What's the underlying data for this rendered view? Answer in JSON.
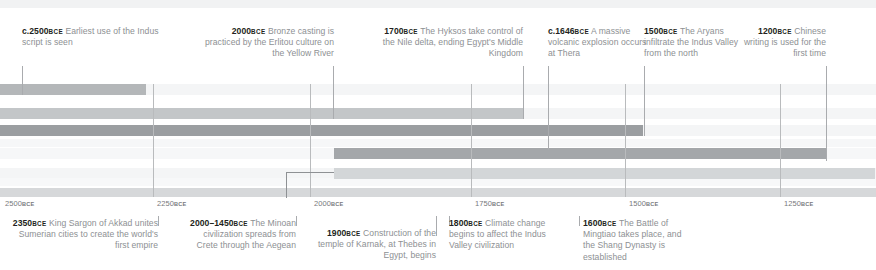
{
  "chart_data": {
    "type": "table",
    "title": "",
    "xlabel": "",
    "ylabel": "",
    "axis": {
      "orientation": "horizontal",
      "direction": "bce-descending",
      "range_bce": [
        2560,
        1180
      ],
      "ticks": [
        {
          "value": 2500,
          "label": "2500",
          "era": "BCE",
          "x": 5
        },
        {
          "value": 2250,
          "label": "2250",
          "era": "BCE",
          "x": 157
        },
        {
          "value": 2000,
          "label": "2000",
          "era": "BCE",
          "x": 314
        },
        {
          "value": 1750,
          "label": "1750",
          "era": "BCE",
          "x": 475
        },
        {
          "value": 1500,
          "label": "1500",
          "era": "BCE",
          "x": 629
        },
        {
          "value": 1250,
          "label": "1250",
          "era": "BCE",
          "x": 784
        }
      ]
    },
    "bars": [
      {
        "name": "era-bar-1",
        "x": 0,
        "width": 146,
        "y": 84,
        "color": "#b4b7b9"
      },
      {
        "name": "era-bar-2",
        "x": 0,
        "width": 523,
        "y": 108,
        "color": "#c3c6c8"
      },
      {
        "name": "era-bar-3",
        "x": 0,
        "width": 643,
        "y": 125,
        "color": "#9b9ea1"
      },
      {
        "name": "era-bar-4",
        "x": 334,
        "width": 492,
        "y": 148,
        "color": "#a4a7aa"
      },
      {
        "name": "era-bar-5",
        "x": 334,
        "width": 541,
        "y": 168,
        "color": "#d3d6d8"
      }
    ],
    "background_bands": [
      {
        "y": 0,
        "height": 8,
        "color": "#f1f2f3"
      },
      {
        "y": 84,
        "height": 11,
        "color": "#f4f5f6"
      },
      {
        "y": 108,
        "height": 11,
        "color": "#f4f5f6"
      },
      {
        "y": 125,
        "height": 11,
        "color": "#f4f5f6"
      },
      {
        "y": 139,
        "height": 8,
        "color": "#f6f7f8"
      },
      {
        "y": 148,
        "height": 11,
        "color": "#f6f7f8"
      },
      {
        "y": 168,
        "height": 11,
        "color": "#f4f5f6"
      },
      {
        "y": 178,
        "height": 8,
        "color": "#f7f8f9"
      }
    ]
  },
  "events_top": [
    {
      "year": "c.2500",
      "era": "BCE",
      "text": "Earliest use of the Indus script is seen",
      "align": "left",
      "label_x": 22,
      "label_y": 26,
      "label_w": 150,
      "leader_x": 22,
      "leader_y": 66,
      "leader_h": 29
    },
    {
      "year": "2000",
      "era": "BCE",
      "text": "Bronze casting is practiced by the Erlitou culture on the Yellow River",
      "align": "right",
      "label_x": 198,
      "label_y": 26,
      "label_w": 136,
      "leader_x": 333,
      "leader_y": 66,
      "leader_h": 53
    },
    {
      "year": "1700",
      "era": "BCE",
      "text": "The Hyksos take control of the Nile delta, ending Egypt's Middle Kingdom",
      "align": "right",
      "label_x": 370,
      "label_y": 26,
      "label_w": 153,
      "leader_x": 523,
      "leader_y": 66,
      "leader_h": 53
    },
    {
      "year": "c.1646",
      "era": "BCE",
      "text": "A massive volcanic explosion occurs at Thera",
      "align": "left",
      "label_x": 548,
      "label_y": 26,
      "label_w": 100,
      "leader_x": 548,
      "leader_y": 66,
      "leader_h": 84
    },
    {
      "year": "1500",
      "era": "BCE",
      "text": "The Aryans infiltrate the Indus Valley from the north",
      "align": "left",
      "label_x": 644,
      "label_y": 26,
      "label_w": 112,
      "leader_x": 644,
      "leader_y": 66,
      "leader_h": 70
    },
    {
      "year": "1200",
      "era": "BCE",
      "text": "Chinese writing is used for the first time",
      "align": "right",
      "label_x": 742,
      "label_y": 26,
      "label_w": 84,
      "leader_x": 826,
      "leader_y": 66,
      "leader_h": 95
    }
  ],
  "events_bottom": [
    {
      "year": "2350",
      "era": "BCE",
      "text": "King Sargon of Akkad unites Sumerian cities to create the world's first empire",
      "align": "right",
      "label_x": 12,
      "label_y": 218,
      "label_w": 146,
      "leader_x": 158,
      "leader_y": 216,
      "leader_h": 10
    },
    {
      "year": "2000–1450",
      "era": "BCE",
      "text": "The Minoan civilization spreads from Crete through the Aegean",
      "align": "right",
      "label_x": 186,
      "label_y": 218,
      "label_w": 110,
      "leader_x": 296,
      "leader_y": 216,
      "leader_h": 10
    },
    {
      "year": "1900",
      "era": "BCE",
      "text": "Construction of the temple of Karnak, at Thebes in Egypt, begins",
      "align": "right",
      "label_x": 300,
      "label_y": 228,
      "label_w": 136,
      "leader_x": 436,
      "leader_y": 216,
      "leader_h": 20
    },
    {
      "year": "1800",
      "era": "BCE",
      "text": "Climate change begins to affect the Indus Valley civilization",
      "align": "left",
      "label_x": 449,
      "label_y": 218,
      "label_w": 110,
      "leader_x": 449,
      "leader_y": 216,
      "leader_h": 10
    },
    {
      "year": "1600",
      "era": "BCE",
      "text": "The Battle of Mingtiao takes place, and the Shang Dynasty is established",
      "align": "left",
      "label_x": 583,
      "label_y": 218,
      "label_w": 110,
      "leader_x": 579,
      "leader_y": 216,
      "leader_h": 10
    }
  ],
  "connector": {
    "name": "minoan-span-connector",
    "x": 286,
    "y": 172,
    "width": 48,
    "vertical_x": 286,
    "vertical_y": 172,
    "vertical_h": 26
  }
}
